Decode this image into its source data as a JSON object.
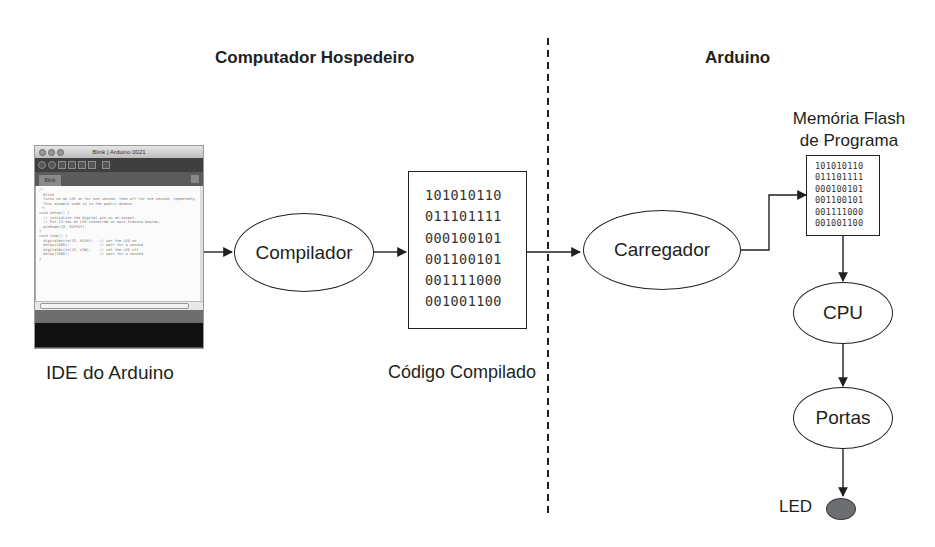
{
  "sections": {
    "host": {
      "title": "Computador Hospedeiro"
    },
    "device": {
      "title": "Arduino"
    }
  },
  "ide": {
    "caption": "IDE do Arduino",
    "window_title": "Blink | Arduino 0021",
    "tab_label": "Blink",
    "code_lines": [
      "/*",
      "  Blink",
      "  Turns on an LED on for one second, then off for one second, repeatedly.",
      "",
      "  This example code is in the public domain.",
      " */",
      "",
      "void setup() {",
      "  // initialize the digital pin as an output.",
      "  // Pin 13 has an LED connected on most Arduino boards:",
      "  pinMode(13, OUTPUT);",
      "}",
      "",
      "void loop() {",
      "  digitalWrite(13, HIGH);   // set the LED on",
      "  delay(1000);              // wait for a second",
      "  digitalWrite(13, LOW);    // set the LED off",
      "  delay(1000);              // wait for a second",
      "}"
    ]
  },
  "nodes": {
    "compiler": "Compilador",
    "loader": "Carregador",
    "cpu": "CPU",
    "ports": "Portas",
    "led": "LED"
  },
  "compiled_code": {
    "caption": "Código Compilado",
    "rows": [
      "101010110",
      "011101111",
      "000100101",
      "001100101",
      "001111000",
      "001001100"
    ]
  },
  "flash_memory": {
    "caption_line1": "Memória Flash",
    "caption_line2": "de Programa",
    "rows": [
      "101010110",
      "011101111",
      "000100101",
      "001100101",
      "001111000",
      "001001100"
    ]
  },
  "colors": {
    "stroke": "#231f20",
    "led_fill": "#6d6e71"
  }
}
